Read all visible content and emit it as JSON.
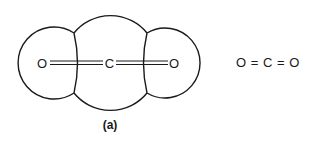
{
  "figure": {
    "caption": "(a)",
    "molecule": {
      "atoms": [
        {
          "label": "O",
          "role": "left-oxygen"
        },
        {
          "label": "C",
          "role": "central-carbon"
        },
        {
          "label": "O",
          "role": "right-oxygen"
        }
      ],
      "bonds": [
        "double",
        "double"
      ]
    },
    "structural_formula": "O = C = O",
    "colors": {
      "line": "#1a1a1a",
      "background": "#ffffff"
    }
  }
}
